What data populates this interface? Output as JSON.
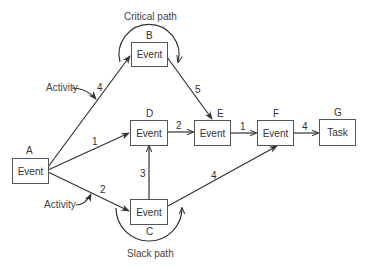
{
  "diagram": {
    "type": "PERT network",
    "captions": {
      "critical_path": "Critical path",
      "slack_path": "Slack path",
      "activity_top": "Activity",
      "activity_bottom": "Activity"
    },
    "nodes": [
      {
        "id": "A",
        "label": "Event"
      },
      {
        "id": "B",
        "label": "Event"
      },
      {
        "id": "C",
        "label": "Event"
      },
      {
        "id": "D",
        "label": "Event"
      },
      {
        "id": "E",
        "label": "Event"
      },
      {
        "id": "F",
        "label": "Event"
      },
      {
        "id": "G",
        "label": "Task"
      }
    ],
    "edges": [
      {
        "from": "A",
        "to": "B",
        "weight": "4"
      },
      {
        "from": "A",
        "to": "D",
        "weight": "1"
      },
      {
        "from": "A",
        "to": "C",
        "weight": "2"
      },
      {
        "from": "B",
        "to": "E",
        "weight": "5"
      },
      {
        "from": "D",
        "to": "E",
        "weight": "2"
      },
      {
        "from": "C",
        "to": "D",
        "weight": "3"
      },
      {
        "from": "C",
        "to": "F",
        "weight": "4"
      },
      {
        "from": "E",
        "to": "F",
        "weight": "1"
      },
      {
        "from": "F",
        "to": "G",
        "weight": "4"
      }
    ]
  }
}
